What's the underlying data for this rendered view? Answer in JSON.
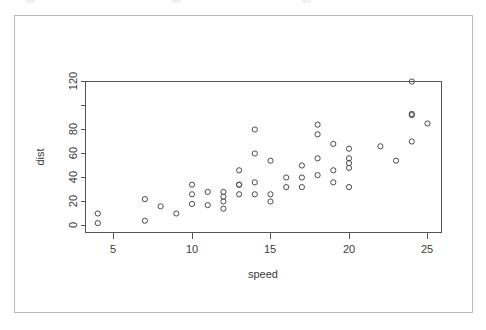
{
  "figure": {
    "card_label": "plot-card",
    "background_color": "#ffffff",
    "frame_color": "#555555",
    "point_color": "#4a4a4a",
    "text_color": "#3a3a3a"
  },
  "chart_data": {
    "type": "scatter",
    "title": "",
    "xlabel": "speed",
    "ylabel": "dist",
    "xlim": [
      3.2,
      25.8
    ],
    "ylim": [
      -3,
      124
    ],
    "grid": false,
    "legend": null,
    "marker": "open-circle",
    "xticks": [
      5,
      10,
      15,
      20,
      25
    ],
    "xticklabels": [
      "5",
      "10",
      "15",
      "20",
      "25"
    ],
    "yticks": [
      0,
      20,
      40,
      60,
      80,
      100,
      120
    ],
    "yticklabels": [
      "0",
      "20",
      "40",
      "60",
      "80",
      "",
      "120"
    ],
    "n_points": 50,
    "x": [
      4,
      4,
      7,
      7,
      8,
      9,
      10,
      10,
      10,
      11,
      11,
      12,
      12,
      12,
      12,
      13,
      13,
      13,
      13,
      14,
      14,
      14,
      14,
      15,
      15,
      15,
      16,
      16,
      17,
      17,
      17,
      18,
      18,
      18,
      18,
      19,
      19,
      19,
      20,
      20,
      20,
      20,
      20,
      22,
      23,
      24,
      24,
      24,
      24,
      25
    ],
    "y": [
      2,
      10,
      4,
      22,
      16,
      10,
      18,
      26,
      34,
      17,
      28,
      14,
      20,
      24,
      28,
      26,
      34,
      34,
      46,
      26,
      36,
      60,
      80,
      20,
      26,
      54,
      32,
      40,
      32,
      40,
      50,
      42,
      56,
      76,
      84,
      36,
      46,
      68,
      32,
      48,
      52,
      56,
      64,
      66,
      54,
      70,
      92,
      93,
      120,
      85
    ]
  }
}
